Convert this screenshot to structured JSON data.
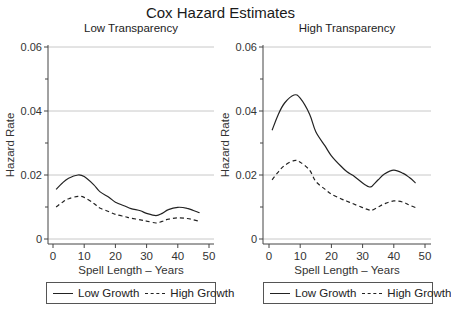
{
  "title": "Cox Hazard Estimates",
  "chart_data": [
    {
      "type": "line",
      "title": "Low Transparency",
      "xlabel": "Spell Length – Years",
      "ylabel": "Hazard Rate",
      "xlim": [
        0,
        50
      ],
      "ylim": [
        0,
        0.06
      ],
      "xticks": [
        0,
        10,
        20,
        30,
        40,
        50
      ],
      "yticks": [
        "0",
        "0.02",
        "0.04",
        "0.06"
      ],
      "grid": true,
      "legend_position": "bottom",
      "series": [
        {
          "name": "Low Growth",
          "style": "solid",
          "x": [
            1,
            3,
            5,
            8,
            10,
            13,
            15,
            18,
            20,
            23,
            25,
            28,
            30,
            33,
            35,
            37,
            40,
            43,
            45,
            47
          ],
          "values": [
            0.0155,
            0.0175,
            0.019,
            0.02,
            0.0195,
            0.017,
            0.0148,
            0.013,
            0.0115,
            0.0103,
            0.0095,
            0.0088,
            0.008,
            0.0073,
            0.008,
            0.0092,
            0.0099,
            0.0096,
            0.0089,
            0.0082
          ]
        },
        {
          "name": "High Growth",
          "style": "dashed",
          "x": [
            1,
            3,
            5,
            8,
            10,
            13,
            15,
            18,
            20,
            23,
            25,
            28,
            30,
            33,
            35,
            37,
            40,
            43,
            45,
            47
          ],
          "values": [
            0.01,
            0.0115,
            0.0126,
            0.0133,
            0.013,
            0.0112,
            0.0097,
            0.0085,
            0.0077,
            0.007,
            0.0065,
            0.006,
            0.0056,
            0.005,
            0.0055,
            0.0062,
            0.0066,
            0.0064,
            0.006,
            0.0055
          ]
        }
      ]
    },
    {
      "type": "line",
      "title": "High Transparency",
      "xlabel": "Spell Length – Years",
      "ylabel": "Hazard Rate",
      "xlim": [
        0,
        50
      ],
      "ylim": [
        0,
        0.06
      ],
      "xticks": [
        0,
        10,
        20,
        30,
        40,
        50
      ],
      "yticks": [
        "0",
        "0.02",
        "0.04",
        "0.06"
      ],
      "grid": true,
      "legend_position": "bottom",
      "series": [
        {
          "name": "Low Growth",
          "style": "solid",
          "x": [
            1,
            3,
            5,
            8,
            10,
            13,
            15,
            18,
            20,
            23,
            25,
            27,
            30,
            32,
            33,
            35,
            37,
            40,
            43,
            45,
            47
          ],
          "values": [
            0.034,
            0.039,
            0.0425,
            0.045,
            0.044,
            0.039,
            0.0335,
            0.029,
            0.026,
            0.0228,
            0.021,
            0.0198,
            0.0175,
            0.0163,
            0.0165,
            0.0185,
            0.0203,
            0.0215,
            0.0205,
            0.0192,
            0.0175
          ]
        },
        {
          "name": "High Growth",
          "style": "dashed",
          "x": [
            1,
            3,
            5,
            8,
            10,
            13,
            15,
            18,
            20,
            23,
            25,
            27,
            30,
            32,
            33,
            35,
            37,
            40,
            43,
            45,
            47
          ],
          "values": [
            0.0185,
            0.021,
            0.023,
            0.0245,
            0.024,
            0.0215,
            0.018,
            0.0155,
            0.014,
            0.0126,
            0.0118,
            0.011,
            0.0098,
            0.0091,
            0.009,
            0.01,
            0.011,
            0.0119,
            0.0115,
            0.0106,
            0.0098
          ]
        }
      ]
    }
  ],
  "panels": [
    {
      "title": "Low Transparency",
      "ylabel": "Hazard Rate",
      "xlabel": "Spell Length – Years",
      "legend": [
        {
          "label": "Low Growth",
          "style": "solid"
        },
        {
          "label": "High Growth",
          "style": "dashed"
        }
      ]
    },
    {
      "title": "High Transparency",
      "ylabel": "Hazard Rate",
      "xlabel": "Spell Length – Years",
      "legend": [
        {
          "label": "Low Growth",
          "style": "solid"
        },
        {
          "label": "High Growth",
          "style": "dashed"
        }
      ]
    }
  ],
  "colors": {
    "line": "#222222",
    "grid": "#c8c8c8",
    "axis": "#444444"
  }
}
